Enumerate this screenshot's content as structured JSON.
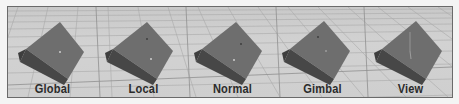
{
  "figure": {
    "colors": {
      "background": "#f4f4f4",
      "panel_border": "#6a6a6a",
      "grid_floor": "#cdcdcd",
      "grid_lines": "#a8a8a8",
      "cube_top_face": "#6f6f6f",
      "cube_side_face": "#4a4a4a",
      "label_text": "#2b2b2b"
    },
    "views": [
      {
        "label": "Global",
        "offset_x": 0
      },
      {
        "label": "Local",
        "offset_x": 91
      },
      {
        "label": "Normal",
        "offset_x": 180
      },
      {
        "label": "Gimbal",
        "offset_x": 270
      },
      {
        "label": "View",
        "offset_x": 358
      }
    ]
  }
}
